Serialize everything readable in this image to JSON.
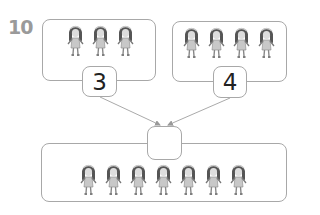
{
  "problem": {
    "number": "10",
    "left_group": {
      "count_label": "3",
      "figure_count": 3
    },
    "right_group": {
      "count_label": "4",
      "figure_count": 4
    },
    "total_group": {
      "count_label": "",
      "figure_count": 7
    },
    "figure_icon": "girl-figure-icon",
    "colors": {
      "border": "#a8a8a8",
      "number": "#9a9a9a",
      "text": "#222222"
    }
  }
}
